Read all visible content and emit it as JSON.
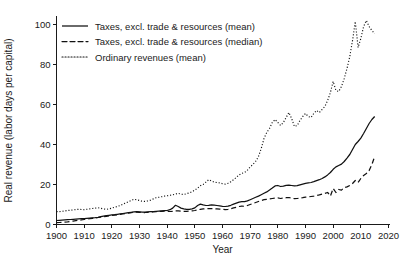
{
  "chart_data": {
    "type": "line",
    "title": "",
    "xlabel": "Year",
    "ylabel": "Real revenue (labor days per capital)",
    "xlim": [
      1900,
      2020
    ],
    "ylim": [
      0,
      104
    ],
    "xticks": [
      1900,
      1910,
      1920,
      1930,
      1940,
      1950,
      1960,
      1970,
      1980,
      1990,
      2000,
      2010,
      2020
    ],
    "yticks": [
      0,
      20,
      40,
      60,
      80,
      100
    ],
    "grid": false,
    "legend_position": "top-left",
    "x": [
      1900,
      1901,
      1902,
      1903,
      1904,
      1905,
      1906,
      1907,
      1908,
      1909,
      1910,
      1911,
      1912,
      1913,
      1914,
      1915,
      1916,
      1917,
      1918,
      1919,
      1920,
      1921,
      1922,
      1923,
      1924,
      1925,
      1926,
      1927,
      1928,
      1929,
      1930,
      1931,
      1932,
      1933,
      1934,
      1935,
      1936,
      1937,
      1938,
      1939,
      1940,
      1941,
      1942,
      1943,
      1944,
      1945,
      1946,
      1947,
      1948,
      1949,
      1950,
      1951,
      1952,
      1953,
      1954,
      1955,
      1956,
      1957,
      1958,
      1959,
      1960,
      1961,
      1962,
      1963,
      1964,
      1965,
      1966,
      1967,
      1968,
      1969,
      1970,
      1971,
      1972,
      1973,
      1974,
      1975,
      1976,
      1977,
      1978,
      1979,
      1980,
      1981,
      1982,
      1983,
      1984,
      1985,
      1986,
      1987,
      1988,
      1989,
      1990,
      1991,
      1992,
      1993,
      1994,
      1995,
      1996,
      1997,
      1998,
      1999,
      2000,
      2001,
      2002,
      2003,
      2004,
      2005,
      2006,
      2007,
      2008,
      2009,
      2010,
      2011,
      2012,
      2013,
      2014,
      2015
    ],
    "series": [
      {
        "name": "Taxes, excl. trade & resources (mean)",
        "style": "solid",
        "values": [
          2.0,
          2.1,
          2.2,
          2.3,
          2.4,
          2.5,
          2.6,
          2.7,
          2.8,
          2.9,
          3.0,
          3.1,
          3.2,
          3.3,
          3.4,
          3.6,
          3.9,
          4.2,
          4.4,
          4.6,
          4.8,
          4.9,
          5.1,
          5.3,
          5.5,
          5.7,
          5.9,
          6.1,
          6.3,
          6.4,
          6.3,
          6.2,
          6.2,
          6.3,
          6.4,
          6.5,
          6.6,
          6.7,
          6.8,
          6.9,
          7.0,
          7.4,
          8.2,
          9.6,
          9.0,
          8.2,
          7.8,
          7.6,
          7.6,
          7.8,
          8.3,
          9.5,
          10.2,
          9.8,
          9.5,
          9.6,
          9.8,
          9.7,
          9.5,
          9.3,
          9.1,
          9.0,
          9.2,
          9.6,
          10.2,
          10.7,
          11.2,
          11.4,
          11.4,
          11.8,
          12.4,
          13.0,
          13.6,
          14.2,
          14.9,
          15.6,
          16.3,
          17.2,
          18.2,
          19.3,
          19.5,
          19.0,
          19.2,
          19.6,
          19.7,
          19.5,
          19.3,
          19.4,
          19.8,
          20.2,
          20.6,
          20.8,
          21.0,
          21.4,
          21.9,
          22.4,
          23.0,
          23.8,
          24.8,
          26.0,
          27.6,
          28.8,
          29.5,
          30.2,
          31.5,
          33.2,
          35.0,
          37.5,
          40.0,
          41.5,
          43.2,
          45.5,
          48.0,
          50.5,
          52.5,
          54.0
        ]
      },
      {
        "name": "Taxes, excl. trade & resources (median)",
        "style": "dashed",
        "values": [
          0.9,
          1.0,
          1.1,
          1.2,
          1.3,
          1.5,
          1.7,
          1.9,
          2.1,
          2.3,
          2.5,
          2.7,
          2.9,
          3.1,
          3.3,
          3.5,
          3.7,
          3.9,
          4.1,
          4.3,
          4.5,
          4.7,
          4.9,
          5.1,
          5.3,
          5.5,
          5.7,
          5.9,
          6.1,
          6.2,
          6.1,
          6.0,
          6.0,
          6.1,
          6.2,
          6.3,
          6.4,
          6.5,
          6.6,
          6.7,
          6.6,
          6.5,
          6.6,
          6.8,
          6.8,
          6.7,
          6.6,
          6.6,
          6.7,
          6.8,
          7.0,
          7.3,
          7.6,
          7.8,
          7.9,
          8.0,
          8.0,
          7.9,
          7.8,
          7.7,
          7.6,
          7.4,
          7.6,
          7.9,
          8.3,
          8.6,
          9.0,
          9.2,
          9.1,
          9.5,
          10.0,
          10.5,
          11.0,
          11.5,
          12.0,
          12.4,
          12.6,
          12.8,
          13.0,
          13.2,
          13.3,
          13.0,
          13.2,
          13.4,
          13.5,
          13.2,
          12.9,
          13.0,
          13.2,
          13.4,
          13.7,
          13.8,
          14.0,
          14.2,
          14.5,
          14.8,
          15.2,
          15.6,
          16.0,
          14.2,
          18.0,
          16.0,
          17.5,
          17.2,
          18.5,
          18.8,
          19.5,
          20.5,
          22.0,
          21.0,
          23.0,
          24.5,
          25.5,
          27.0,
          30.0,
          34.0
        ]
      },
      {
        "name": "Ordinary revenues (mean)",
        "style": "dotted",
        "values": [
          6.5,
          6.4,
          6.6,
          6.8,
          7.0,
          7.1,
          7.3,
          7.5,
          7.6,
          7.5,
          7.4,
          7.6,
          7.8,
          8.0,
          8.2,
          8.4,
          8.1,
          7.8,
          7.6,
          7.8,
          8.2,
          8.6,
          9.0,
          9.5,
          10.2,
          10.8,
          11.4,
          12.0,
          12.6,
          12.4,
          12.0,
          11.6,
          11.6,
          11.8,
          12.2,
          12.8,
          13.4,
          13.6,
          13.9,
          14.2,
          14.4,
          14.6,
          14.8,
          15.2,
          15.6,
          15.2,
          15.0,
          15.4,
          15.8,
          16.4,
          17.2,
          18.2,
          19.4,
          20.0,
          21.2,
          22.4,
          21.8,
          21.2,
          21.0,
          20.8,
          20.4,
          20.2,
          20.6,
          21.4,
          22.4,
          23.6,
          24.8,
          25.6,
          26.0,
          27.2,
          28.8,
          30.0,
          31.6,
          34.0,
          38.0,
          43.0,
          46.0,
          48.0,
          51.0,
          52.5,
          51.0,
          49.5,
          51.0,
          53.5,
          56.0,
          53.0,
          49.0,
          49.5,
          52.0,
          54.0,
          55.5,
          54.0,
          53.5,
          55.5,
          57.0,
          56.0,
          57.5,
          59.0,
          62.0,
          66.0,
          71.5,
          67.0,
          66.5,
          69.0,
          73.0,
          78.0,
          84.0,
          92.0,
          101.5,
          88.5,
          93.0,
          99.0,
          102.0,
          99.0,
          97.0,
          95.5
        ]
      }
    ]
  },
  "legend": {
    "entries": [
      {
        "label": "Taxes, excl. trade & resources (mean)",
        "style": "solid"
      },
      {
        "label": "Taxes, excl. trade & resources (median)",
        "style": "dashed"
      },
      {
        "label": "Ordinary revenues (mean)",
        "style": "dotted"
      }
    ]
  },
  "colors": {
    "ink": "#1a1a1a",
    "series": "#111111",
    "background": "#ffffff"
  }
}
